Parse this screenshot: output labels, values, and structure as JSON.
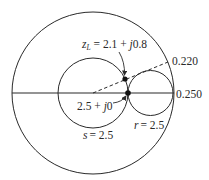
{
  "diagram": {
    "type": "smith-chart",
    "colors": {
      "stroke": "#2a2a2a",
      "background": "#ffffff"
    },
    "outer_circle": {
      "cx": 93,
      "cy": 93,
      "r": 81
    },
    "s_circle": {
      "cx": 93,
      "cy": 93,
      "r": 35,
      "label": "s = 2.5",
      "label_var": "s",
      "label_val": "= 2.5"
    },
    "r_circle": {
      "cx": 150.5,
      "cy": 93,
      "r": 22.5,
      "label": "r = 2.5",
      "label_var": "r",
      "label_val": "= 2.5"
    },
    "real_axis": {
      "x1": 12,
      "y1": 93,
      "x2": 174,
      "y2": 93
    },
    "dashed_line": {
      "x1": 93,
      "y1": 93,
      "x2": 168,
      "y2": 62
    },
    "points": {
      "load": {
        "x": 125,
        "y": 79,
        "label": "z_L = 2.1 + j0.8",
        "label_var": "z",
        "label_sub": "L",
        "label_eq": " = 2.1 + ",
        "label_j": "j",
        "label_tail": "0.8"
      },
      "match": {
        "x": 128,
        "y": 93,
        "label": "2.5 + j0",
        "label_head": "2.5 + ",
        "label_j": "j",
        "label_tail": "0"
      }
    },
    "scale_labels": {
      "wavelength_load": "0.220",
      "wavelength_max": "0.250"
    }
  }
}
